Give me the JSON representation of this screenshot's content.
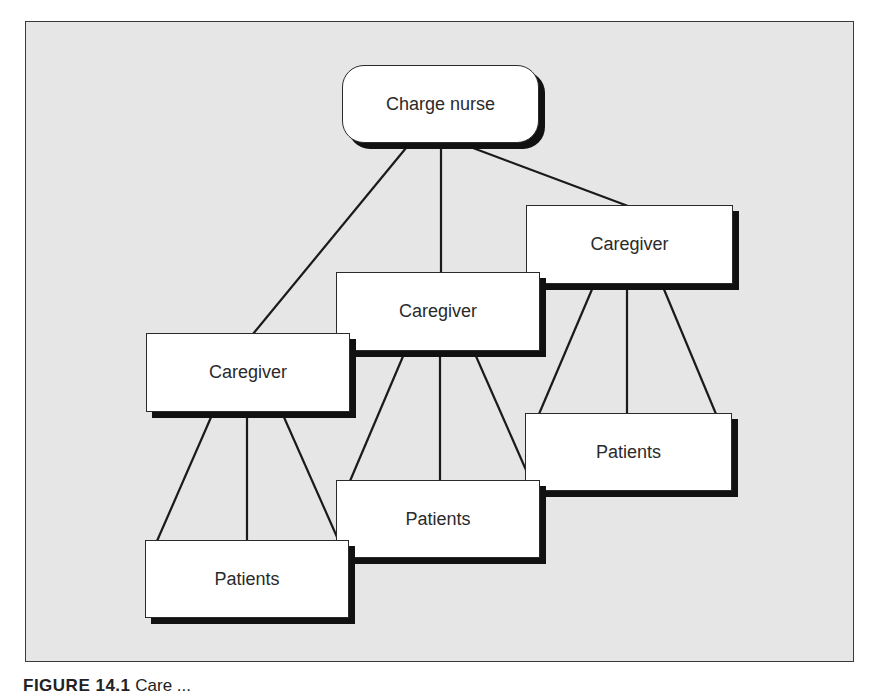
{
  "diagram": {
    "type": "hierarchy",
    "root": {
      "id": "charge",
      "label": "Charge nurse"
    },
    "caregivers": [
      {
        "id": "cg_left",
        "label": "Caregiver",
        "patients": {
          "id": "pt_left",
          "label": "Patients"
        }
      },
      {
        "id": "cg_mid",
        "label": "Caregiver",
        "patients": {
          "id": "pt_mid",
          "label": "Patients"
        }
      },
      {
        "id": "cg_right",
        "label": "Caregiver",
        "patients": {
          "id": "pt_right",
          "label": "Patients"
        }
      }
    ],
    "edges": [
      [
        "charge",
        "cg_left"
      ],
      [
        "charge",
        "cg_mid"
      ],
      [
        "charge",
        "cg_right"
      ],
      [
        "cg_left",
        "pt_left"
      ],
      [
        "cg_mid",
        "pt_mid"
      ],
      [
        "cg_right",
        "pt_right"
      ]
    ],
    "connector_count_per_caregiver": 3
  },
  "caption": {
    "figure_label": "FIGURE 14.1",
    "text": "Care ..."
  },
  "colors": {
    "panel_background": "#e6e6e6",
    "node_fill": "#ffffff",
    "line": "#1a1a1a",
    "shadow": "#111111"
  }
}
